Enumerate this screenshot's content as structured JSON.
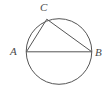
{
  "figure": {
    "background_color": "#ffffff",
    "stroke_color": "#555555",
    "label_color": "#4a4a4a",
    "stroke_width": 1
  },
  "labels": {
    "a": "A",
    "b": "B",
    "c": "C"
  },
  "chart_data": {
    "type": "diagram",
    "shapes": [
      {
        "kind": "circle",
        "name": "circumscribed-circle",
        "cx": 59,
        "cy": 51.5,
        "r": 32.8,
        "fill": "none",
        "stroke": "#555555"
      },
      {
        "kind": "line",
        "name": "chord-ab",
        "from": "A",
        "to": "B",
        "x1": 26.4,
        "y1": 51.8,
        "x2": 91.8,
        "y2": 51.8,
        "stroke": "#555555"
      },
      {
        "kind": "line",
        "name": "chord-ac",
        "from": "A",
        "to": "C",
        "x1": 26.4,
        "y1": 51.8,
        "x2": 46.8,
        "y2": 19.2,
        "stroke": "#555555"
      },
      {
        "kind": "line",
        "name": "chord-cb",
        "from": "C",
        "to": "B",
        "x1": 46.8,
        "y1": 19.2,
        "x2": 91.8,
        "y2": 51.8,
        "stroke": "#555555"
      }
    ],
    "points": [
      {
        "name": "A",
        "label": "A",
        "x": 26.4,
        "y": 51.8,
        "label_x": 14,
        "label_y": 52
      },
      {
        "name": "B",
        "label": "B",
        "x": 91.8,
        "y": 51.8,
        "label_x": 99,
        "label_y": 53
      },
      {
        "name": "C",
        "label": "C",
        "x": 46.8,
        "y": 19.2,
        "label_x": 44,
        "label_y": 8
      }
    ]
  }
}
